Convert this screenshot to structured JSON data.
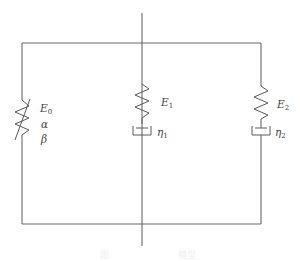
{
  "diagram": {
    "stroke_color": "#6a6a6a",
    "background": "#ffffff",
    "branches": [
      {
        "id": "branch-0",
        "element": "nonlinear-spring",
        "labels": {
          "E": "E",
          "E_sub": "0",
          "alpha": "α",
          "beta": "β"
        }
      },
      {
        "id": "branch-1",
        "element": "spring-dashpot-series",
        "labels": {
          "E": "E",
          "E_sub": "1",
          "eta": "η",
          "eta_sub": "1"
        }
      },
      {
        "id": "branch-2",
        "element": "spring-dashpot-series",
        "labels": {
          "E": "E",
          "E_sub": "2",
          "eta": "η",
          "eta_sub": "2"
        }
      }
    ],
    "caption": {
      "left": "图",
      "right": "模型"
    }
  }
}
